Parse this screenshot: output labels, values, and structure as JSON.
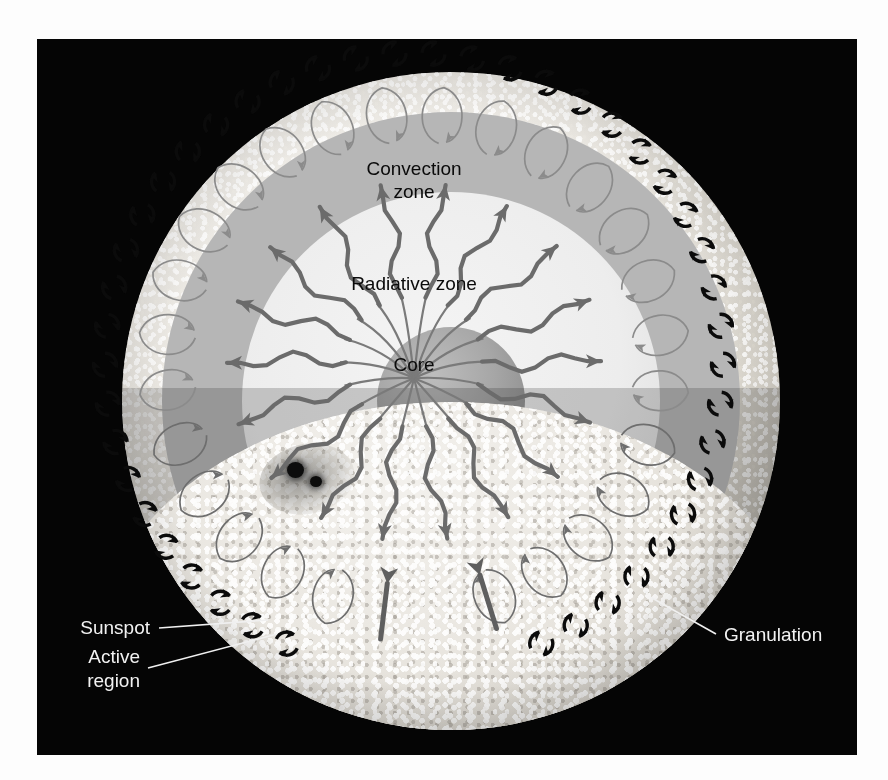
{
  "figure": {
    "background_color": "#050505",
    "plate": {
      "left": 37,
      "top": 39,
      "width": 820,
      "height": 716
    }
  },
  "labels": {
    "convection_zone_line1": "Convection",
    "convection_zone_line2": "zone",
    "radiative_zone": "Radiative zone",
    "core": "Core",
    "sunspot": "Sunspot",
    "active_region_line1": "Active",
    "active_region_line2": "region",
    "granulation": "Granulation"
  },
  "colors": {
    "plate_background": "#050505",
    "surface_band": "#8d8d8d",
    "convection_zone": "#b6b6b6",
    "radiative_zone": "#ededed",
    "core": "#a6a6a6",
    "photosphere": "#e9e6e0",
    "interior_label_text": "#0a0a0a",
    "exterior_label_text": "#f2f2f2",
    "photon_arrow": "#6b6b6b",
    "convection_loop": "#8b8b8b",
    "rotation_arrow": "#0b0b0b",
    "sunspot": "#0c0c0c"
  },
  "geometry": {
    "sun_center_x": 414,
    "sun_center_y": 362,
    "sun_radius": 329,
    "surface_band_inner_radius": 285,
    "convection_inner_radius": 249,
    "radiative_outer_radius": 209,
    "core_radius": 74,
    "cutaway_horizon_y": 404
  },
  "structure_layers": [
    {
      "name": "core",
      "label": "Core"
    },
    {
      "name": "radiative-zone",
      "label": "Radiative zone"
    },
    {
      "name": "convection-zone",
      "label": "Convection zone"
    },
    {
      "name": "photosphere",
      "label": "Granulation"
    }
  ],
  "features": [
    {
      "name": "sunspot",
      "label": "Sunspot"
    },
    {
      "name": "active-region",
      "label": "Active region"
    }
  ],
  "annotations": {
    "rotation_arrow_count": 44,
    "convection_cell_count": 26,
    "photon_path_count": 18
  }
}
